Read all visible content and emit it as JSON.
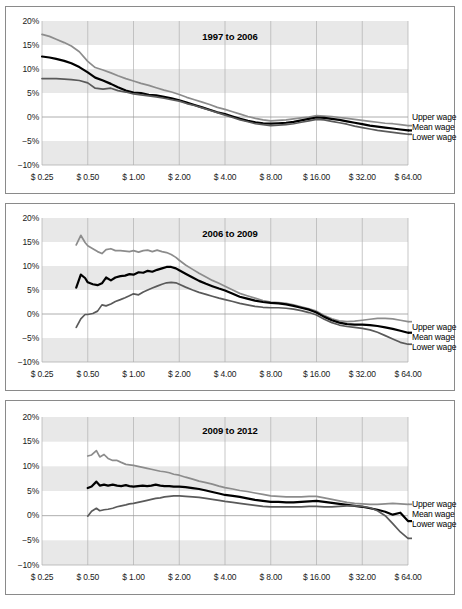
{
  "figure": {
    "width": 462,
    "height": 609,
    "background": "#ffffff",
    "band_color": "#e8e8e8",
    "gridline_color": "#b0b0b0",
    "zero_line_color": "#9a9a9a",
    "border_color": "#8a8a8a",
    "upper_color": "#8c8c8c",
    "mean_color": "#000000",
    "lower_color": "#5a5a5a"
  },
  "legend": {
    "upper_label": "Upper wage",
    "mean_label": "Mean wage",
    "lower_label": "Lower wage"
  },
  "axis": {
    "y_ticks": [
      "20%",
      "15%",
      "10%",
      "5%",
      "0%",
      "−5%",
      "−10%"
    ],
    "y_values": [
      20,
      15,
      10,
      5,
      0,
      -5,
      -10
    ],
    "x_ticks": [
      "$ 0.25",
      "$ 0.50",
      "$ 1.00",
      "$ 2.00",
      "$ 4.00",
      "$ 8.00",
      "$ 16.00",
      "$ 32.00",
      "$ 64.00"
    ],
    "x_values": [
      0.25,
      0.5,
      1,
      2,
      4,
      8,
      16,
      32,
      64
    ],
    "y_label": "",
    "x_label": "",
    "ylim": [
      -10,
      20
    ],
    "xlim": [
      0.25,
      64
    ],
    "x_scale": "log2",
    "grid": true,
    "bands": [
      [
        15,
        20
      ],
      [
        5,
        10
      ],
      [
        -10,
        -5
      ]
    ]
  },
  "chart_data": [
    {
      "type": "line",
      "title": "1997 to 2006",
      "xlabel": "",
      "ylabel": "",
      "xlim": [
        0.25,
        64
      ],
      "ylim": [
        -10,
        20
      ],
      "x_scale": "log2",
      "grid": true,
      "legend_position": "right",
      "x": [
        0.25,
        0.28,
        0.31,
        0.35,
        0.39,
        0.44,
        0.5,
        0.56,
        0.63,
        0.71,
        0.79,
        0.89,
        1.0,
        1.12,
        1.26,
        1.41,
        1.59,
        1.78,
        2.0,
        2.24,
        2.52,
        2.83,
        3.17,
        3.56,
        4.0,
        4.49,
        5.04,
        5.66,
        6.35,
        7.13,
        8.0,
        8.98,
        10.08,
        11.31,
        12.7,
        14.25,
        16.0,
        17.96,
        20.16,
        22.63,
        25.4,
        28.51,
        32.0,
        35.92,
        40.32,
        45.25,
        50.8,
        57.02,
        64.0
      ],
      "series": [
        {
          "name": "Upper wage",
          "values": [
            17.2,
            16.8,
            16.2,
            15.5,
            14.8,
            13.6,
            11.6,
            10.3,
            9.8,
            9.2,
            8.6,
            8.0,
            7.5,
            7.0,
            6.6,
            6.1,
            5.6,
            5.2,
            4.7,
            4.1,
            3.6,
            3.1,
            2.6,
            2.0,
            1.6,
            1.1,
            0.6,
            0.1,
            -0.3,
            -0.6,
            -0.8,
            -0.7,
            -0.6,
            -0.4,
            -0.2,
            0.0,
            0.3,
            0.2,
            0.1,
            -0.1,
            -0.3,
            -0.5,
            -0.7,
            -0.9,
            -1.1,
            -1.3,
            -1.4,
            -1.6,
            -1.8
          ]
        },
        {
          "name": "Mean wage",
          "values": [
            12.6,
            12.4,
            12.1,
            11.7,
            11.2,
            10.4,
            9.3,
            8.2,
            7.6,
            6.9,
            6.2,
            5.5,
            5.1,
            5.0,
            4.6,
            4.5,
            4.2,
            3.9,
            3.5,
            3.0,
            2.5,
            2.0,
            1.5,
            1.0,
            0.6,
            0.1,
            -0.4,
            -0.8,
            -1.1,
            -1.3,
            -1.4,
            -1.3,
            -1.2,
            -1.0,
            -0.7,
            -0.4,
            -0.1,
            -0.2,
            -0.4,
            -0.6,
            -0.9,
            -1.2,
            -1.5,
            -1.8,
            -2.0,
            -2.2,
            -2.4,
            -2.6,
            -2.8
          ]
        },
        {
          "name": "Lower wage",
          "values": [
            8.0,
            8.0,
            8.0,
            7.9,
            7.8,
            7.6,
            7.1,
            6.0,
            5.8,
            6.0,
            5.5,
            5.2,
            4.8,
            4.6,
            4.4,
            4.2,
            3.9,
            3.6,
            3.3,
            2.8,
            2.4,
            1.9,
            1.4,
            0.9,
            0.4,
            -0.1,
            -0.6,
            -1.0,
            -1.4,
            -1.6,
            -1.8,
            -1.7,
            -1.6,
            -1.4,
            -1.1,
            -0.8,
            -0.5,
            -0.6,
            -0.9,
            -1.2,
            -1.5,
            -1.9,
            -2.2,
            -2.5,
            -2.8,
            -3.0,
            -3.2,
            -3.4,
            -3.6
          ]
        }
      ]
    },
    {
      "type": "line",
      "title": "2006 to 2009",
      "xlabel": "",
      "ylabel": "",
      "xlim": [
        0.25,
        64
      ],
      "ylim": [
        -10,
        20
      ],
      "x_scale": "log2",
      "grid": true,
      "legend_position": "right",
      "x": [
        0.42,
        0.45,
        0.48,
        0.5,
        0.54,
        0.58,
        0.62,
        0.66,
        0.71,
        0.76,
        0.82,
        0.88,
        0.94,
        1.0,
        1.08,
        1.16,
        1.24,
        1.33,
        1.43,
        1.54,
        1.65,
        1.77,
        1.9,
        2.0,
        2.2,
        2.45,
        2.7,
        3.0,
        3.3,
        3.65,
        4.0,
        4.5,
        5.0,
        5.6,
        6.3,
        7.1,
        8.0,
        9.0,
        10.1,
        11.3,
        12.7,
        14.3,
        16.0,
        18.0,
        20.2,
        22.6,
        25.4,
        28.5,
        32.0,
        36.0,
        40.3,
        45.3,
        50.8,
        57.0,
        64.0
      ],
      "series": [
        {
          "name": "Upper wage",
          "values": [
            14.4,
            16.4,
            14.9,
            14.2,
            13.6,
            13.0,
            12.6,
            13.4,
            13.6,
            13.2,
            13.2,
            13.1,
            13.0,
            13.2,
            12.9,
            13.2,
            13.3,
            13.0,
            13.3,
            13.0,
            12.8,
            12.4,
            11.8,
            11.2,
            10.2,
            9.3,
            8.5,
            7.7,
            7.0,
            6.4,
            5.8,
            5.0,
            4.3,
            3.8,
            3.3,
            2.8,
            2.5,
            2.4,
            2.2,
            1.9,
            1.5,
            1.1,
            0.6,
            -0.3,
            -1.0,
            -1.4,
            -1.6,
            -1.5,
            -1.3,
            -1.1,
            -0.9,
            -0.9,
            -1.0,
            -1.3,
            -1.6
          ]
        },
        {
          "name": "Mean wage",
          "values": [
            5.5,
            8.2,
            7.5,
            6.6,
            6.2,
            6.0,
            6.4,
            7.6,
            7.0,
            7.6,
            7.9,
            8.0,
            8.3,
            8.2,
            8.7,
            8.6,
            9.0,
            8.8,
            9.2,
            9.5,
            9.8,
            9.8,
            9.5,
            9.1,
            8.4,
            7.6,
            6.9,
            6.3,
            5.8,
            5.3,
            4.9,
            4.2,
            3.6,
            3.2,
            2.8,
            2.5,
            2.3,
            2.2,
            2.0,
            1.7,
            1.3,
            0.9,
            0.3,
            -0.6,
            -1.3,
            -1.8,
            -2.1,
            -2.2,
            -2.2,
            -2.3,
            -2.5,
            -2.8,
            -3.1,
            -3.5,
            -3.9
          ]
        },
        {
          "name": "Lower wage",
          "values": [
            -2.8,
            -1.0,
            -0.1,
            -0.1,
            0.1,
            0.6,
            1.9,
            1.7,
            2.1,
            2.6,
            3.0,
            3.4,
            3.8,
            4.2,
            4.0,
            4.6,
            5.0,
            5.4,
            5.8,
            6.2,
            6.5,
            6.6,
            6.5,
            6.2,
            5.6,
            5.0,
            4.5,
            4.1,
            3.7,
            3.3,
            3.0,
            2.6,
            2.2,
            1.9,
            1.6,
            1.4,
            1.3,
            1.3,
            1.2,
            1.0,
            0.7,
            0.3,
            -0.2,
            -1.1,
            -1.8,
            -2.3,
            -2.6,
            -2.8,
            -3.0,
            -3.3,
            -3.8,
            -4.5,
            -5.2,
            -5.9,
            -6.3
          ]
        }
      ]
    },
    {
      "type": "line",
      "title": "2009 to 2012",
      "xlabel": "",
      "ylabel": "",
      "xlim": [
        0.25,
        64
      ],
      "ylim": [
        -10,
        20
      ],
      "x_scale": "log2",
      "grid": true,
      "legend_position": "right",
      "x": [
        0.5,
        0.53,
        0.57,
        0.6,
        0.64,
        0.68,
        0.73,
        0.78,
        0.83,
        0.89,
        0.94,
        1.0,
        1.07,
        1.15,
        1.23,
        1.31,
        1.4,
        1.5,
        1.6,
        1.72,
        1.84,
        2.0,
        2.2,
        2.45,
        2.7,
        3.0,
        3.3,
        3.65,
        4.0,
        4.5,
        5.0,
        5.6,
        6.3,
        7.1,
        8.0,
        9.0,
        10.1,
        11.3,
        12.7,
        14.3,
        16.0,
        18.0,
        20.2,
        22.6,
        25.4,
        28.5,
        32.0,
        36.0,
        40.3,
        45.3,
        50.8,
        57.0,
        64.0
      ],
      "series": [
        {
          "name": "Upper wage",
          "values": [
            12.1,
            12.3,
            13.2,
            11.9,
            12.4,
            11.6,
            11.2,
            11.2,
            10.8,
            10.4,
            10.3,
            10.2,
            10.0,
            9.8,
            9.6,
            9.4,
            9.2,
            9.0,
            8.9,
            8.7,
            8.4,
            8.2,
            7.8,
            7.4,
            7.0,
            6.7,
            6.4,
            6.0,
            5.7,
            5.4,
            5.1,
            4.9,
            4.6,
            4.3,
            4.0,
            3.9,
            3.8,
            3.8,
            3.8,
            3.9,
            3.9,
            3.6,
            3.3,
            3.0,
            2.7,
            2.5,
            2.4,
            2.3,
            2.3,
            2.4,
            2.5,
            2.4,
            2.3
          ]
        },
        {
          "name": "Mean wage",
          "values": [
            5.6,
            5.9,
            6.9,
            6.1,
            6.3,
            6.1,
            6.3,
            6.1,
            6.0,
            6.2,
            6.0,
            5.9,
            6.0,
            6.1,
            6.0,
            6.1,
            6.3,
            6.1,
            6.0,
            6.0,
            5.9,
            5.9,
            5.8,
            5.6,
            5.4,
            5.1,
            4.8,
            4.5,
            4.2,
            4.0,
            3.8,
            3.5,
            3.2,
            3.0,
            2.8,
            2.8,
            2.7,
            2.7,
            2.8,
            2.9,
            3.0,
            2.8,
            2.6,
            2.4,
            2.2,
            2.0,
            1.8,
            1.5,
            1.2,
            0.8,
            0.2,
            0.6,
            -1.1
          ]
        },
        {
          "name": "Lower wage",
          "values": [
            -0.1,
            0.9,
            1.5,
            1.0,
            1.2,
            1.3,
            1.5,
            1.8,
            2.0,
            2.2,
            2.4,
            2.5,
            2.7,
            2.9,
            3.1,
            3.3,
            3.5,
            3.6,
            3.8,
            3.9,
            4.0,
            4.0,
            3.9,
            3.8,
            3.7,
            3.5,
            3.3,
            3.1,
            2.9,
            2.7,
            2.5,
            2.3,
            2.1,
            1.9,
            1.8,
            1.8,
            1.8,
            1.8,
            1.8,
            1.9,
            1.9,
            1.8,
            1.8,
            1.9,
            2.0,
            2.0,
            1.9,
            1.6,
            1.0,
            0.0,
            -1.6,
            -3.3,
            -4.6
          ]
        }
      ]
    }
  ]
}
